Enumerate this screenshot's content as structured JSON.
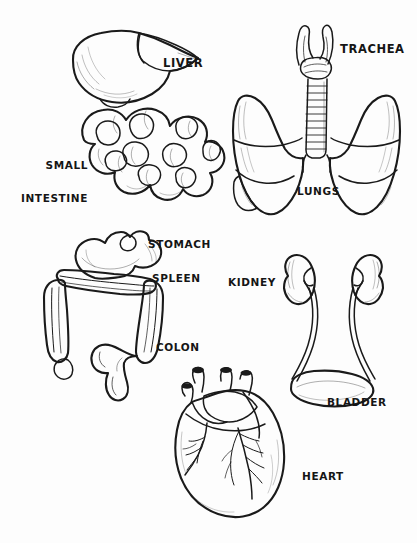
{
  "page": {
    "background_color": "#fdfdfd",
    "ink_color": "#1a1a1a",
    "style": "pen-and-ink hand-drawn sketch with graphite shading",
    "width": 417,
    "height": 543
  },
  "figures": [
    {
      "id": "liver",
      "label": "LIVER",
      "label_lines": [
        "LIVER"
      ],
      "label_x": 163,
      "label_y": 57,
      "organ_name": "liver",
      "position": "top-left",
      "description": "Wedge-shaped liver with large right lobe and tapering left lobe, gallbladder below"
    },
    {
      "id": "small-intestine",
      "label": "SMALL INTESTINE",
      "label_lines": [
        "SMALL",
        "INTESTINE"
      ],
      "label_x": 18,
      "label_y": 140,
      "organ_name": "small intestine",
      "position": "top-left",
      "description": "Coiled loops of small intestine beneath the liver"
    },
    {
      "id": "trachea",
      "label": "TRACHEA",
      "label_lines": [
        "TRACHEA"
      ],
      "label_x": 340,
      "label_y": 43,
      "organ_name": "trachea",
      "position": "top-right",
      "description": "Ringed windpipe with larynx at top, branching into bronchi"
    },
    {
      "id": "lungs",
      "label": "LUNGS",
      "label_lines": [
        "LUNGS"
      ],
      "label_x": 297,
      "label_y": 186,
      "organ_name": "lungs",
      "position": "top-right",
      "description": "Pair of lobed lungs flanking the trachea"
    },
    {
      "id": "stomach",
      "label": "STOMACH",
      "label_lines": [
        "STOMACH"
      ],
      "label_x": 148,
      "label_y": 239,
      "organ_name": "stomach",
      "position": "middle-left",
      "description": "J-shaped stomach resting atop the transverse colon"
    },
    {
      "id": "spleen",
      "label": "SPLEEN",
      "label_lines": [
        "SPLEEN"
      ],
      "label_x": 152,
      "label_y": 273,
      "organ_name": "spleen",
      "position": "middle-left",
      "description": "Spleen tucked at the left side beneath the stomach"
    },
    {
      "id": "colon",
      "label": "COLON",
      "label_lines": [
        "COLON"
      ],
      "label_x": 156,
      "label_y": 342,
      "organ_name": "colon",
      "position": "middle-left",
      "description": "Frame-shaped large intestine with ascending, transverse, descending colon and sigmoid"
    },
    {
      "id": "kidney",
      "label": "KIDNEY",
      "label_lines": [
        "KIDNEY"
      ],
      "label_x": 228,
      "label_y": 277,
      "organ_name": "kidney",
      "position": "middle-right",
      "description": "Pair of bean-shaped kidneys with ureters descending"
    },
    {
      "id": "bladder",
      "label": "BLADDER",
      "label_lines": [
        "BLADDER"
      ],
      "label_x": 327,
      "label_y": 397,
      "organ_name": "bladder",
      "position": "middle-right",
      "description": "Urinary bladder joined by both ureters"
    },
    {
      "id": "heart",
      "label": "HEART",
      "label_lines": [
        "HEART"
      ],
      "label_x": 302,
      "label_y": 471,
      "organ_name": "heart",
      "position": "bottom-center",
      "description": "Heart with great vessels at top and coronary arteries branching over the ventricles"
    }
  ]
}
